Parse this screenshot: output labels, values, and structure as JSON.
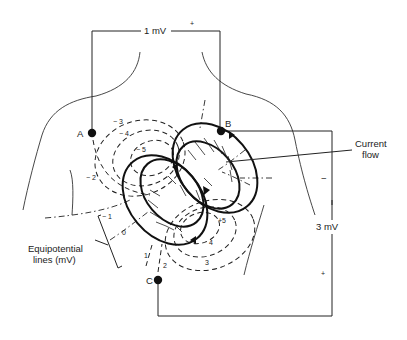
{
  "leads": {
    "top_voltage": "1 mV",
    "top_polarity": "+",
    "right_voltage": "3 mV",
    "right_minus": "−",
    "right_plus": "+"
  },
  "electrodes": [
    {
      "id": "A",
      "label": "A"
    },
    {
      "id": "B",
      "label": "B"
    },
    {
      "id": "C",
      "label": "C"
    }
  ],
  "annotations": {
    "current_flow_line1": "Current",
    "current_flow_line2": "flow",
    "equipotential_line1": "Equipotential",
    "equipotential_line2": "lines (mV)"
  },
  "equipotential_labels": {
    "neg3": "− 3",
    "neg4": "− 4",
    "neg5": "− 5",
    "neg2": "− 2",
    "neg1": "− 1",
    "zero": "0",
    "pos1": "1",
    "pos2": "2",
    "pos3": "3",
    "pos4": "4",
    "pos5": "+5"
  },
  "colors": {
    "ink": "#222222",
    "background": "#ffffff"
  }
}
